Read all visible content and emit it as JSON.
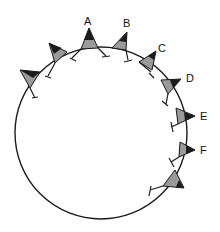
{
  "diagram": {
    "title": "",
    "colors": {
      "line": "#1a1a1a",
      "flag_dark": "#1c1c1c",
      "flag_light": "#9a9a9a",
      "background": "#ffffff"
    },
    "labels": [
      {
        "id": "A",
        "text": "A"
      },
      {
        "id": "B",
        "text": "B"
      },
      {
        "id": "C",
        "text": "C"
      },
      {
        "id": "D",
        "text": "D"
      },
      {
        "id": "E",
        "text": "E"
      },
      {
        "id": "F",
        "text": "F"
      }
    ],
    "flag_count": 9
  }
}
